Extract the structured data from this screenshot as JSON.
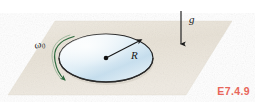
{
  "figure": {
    "title_ref": "E7.4.9",
    "labels": {
      "gravity": "g",
      "radius": "R",
      "angular_velocity_symbol": "ω",
      "angular_velocity_subscript": "0"
    },
    "colors": {
      "plane_fill": "#e9e3d8",
      "plane_fill_light": "#f3efe7",
      "disk_edge": "#1a1a1a",
      "disk_fill_light": "#f2f8fb",
      "disk_fill_blue": "#b9d7e8",
      "spin_arrow": "#2f6b3f",
      "gravity_arrow": "#1b1b1b",
      "figref": "#e8665a",
      "background": "#ffffff"
    },
    "geometry": {
      "plane_corners": "55,21 232,21 186,95 8,95",
      "disk_center_x": 106,
      "disk_center_y": 58,
      "disk_radius_x": 47,
      "disk_radius_y": 24,
      "gravity_arrow_x": 181,
      "gravity_arrow_top_y": 11,
      "gravity_arrow_bottom_y": 45
    }
  }
}
